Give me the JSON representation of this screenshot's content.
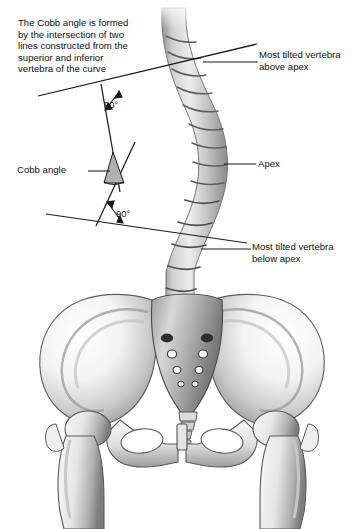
{
  "figure": {
    "background_color": "#ffffff",
    "line_color": "#1a1a1a",
    "bone_light": "#fdfdfd",
    "bone_mid": "#b9b9b9",
    "bone_dark": "#6e6e6e",
    "wedge_fill": "#b0b0b0"
  },
  "description": {
    "text": "The Cobb angle is formed\nby the intersection of two\nlines constructed from the\nsuperior and inferior\nvertebra of the curve"
  },
  "labels": {
    "above_apex": "Most tilted vertebra\nabove apex",
    "apex": "Apex",
    "below_apex": "Most tilted vertebra\nbelow apex",
    "cobb_angle": "Cobb angle",
    "angle_top": "90°",
    "angle_bottom": "90°"
  },
  "anatomy": {
    "parts": [
      "thoracic-spine",
      "lumbar-spine",
      "sacrum",
      "coccyx",
      "left-ilium",
      "right-ilium",
      "pubic-symphysis",
      "left-obturator-foramen",
      "right-obturator-foramen",
      "left-femur",
      "right-femur"
    ]
  },
  "geometry": {
    "superior_endplate_line": {
      "x1": 38,
      "y1": 96,
      "x2": 257,
      "y2": 44
    },
    "inferior_endplate_line": {
      "x1": 46,
      "y1": 214,
      "x2": 247,
      "y2": 243
    },
    "perpendicular_upper": {
      "x1": 101,
      "y1": 84,
      "x2": 117,
      "y2": 176
    },
    "perpendicular_lower": {
      "x1": 97,
      "y1": 225,
      "x2": 131,
      "y2": 147
    },
    "cobb_vertex": {
      "x": 113,
      "y": 163
    },
    "cobb_angle_degrees": 27
  }
}
